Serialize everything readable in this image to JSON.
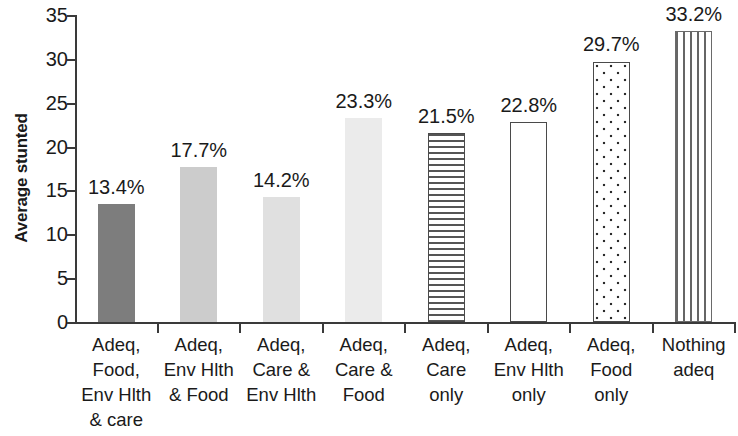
{
  "chart_data": {
    "type": "bar",
    "title": "",
    "xlabel": "",
    "ylabel": "Average stunted",
    "ylim": [
      0,
      35
    ],
    "ytick_values": [
      35,
      30,
      25,
      20,
      15,
      10,
      5,
      0
    ],
    "ytick_labels": [
      "35",
      "30",
      "25",
      "20",
      "15",
      "10",
      "5",
      "0"
    ],
    "grid": false,
    "legend": "none",
    "categories": [
      "Adeq, Food, Env Hlth & care",
      "Adeq, Env Hlth & Food",
      "Adeq, Care & Env Hlth",
      "Adeq, Care & Food",
      "Adeq, Care only",
      "Adeq, Env Hlth only",
      "Adeq, Food only",
      "Nothing adeq"
    ],
    "values": [
      13.4,
      17.7,
      14.2,
      23.3,
      21.5,
      22.8,
      29.7,
      33.2
    ],
    "data_labels": [
      "13.4%",
      "17.7%",
      "14.2%",
      "23.3%",
      "21.5%",
      "22.8%",
      "29.7%",
      "33.2%"
    ],
    "bars": [
      {
        "label_lines": [
          "Adeq,",
          "Food,",
          "Env Hlth",
          "& care"
        ],
        "value": 13.4,
        "data_label": "13.4%",
        "fill_style": "solid-dark-gray",
        "fill_class": "fill-dark",
        "color": "#7d7d7d"
      },
      {
        "label_lines": [
          "Adeq,",
          "Env Hlth",
          "& Food"
        ],
        "value": 17.7,
        "data_label": "17.7%",
        "fill_style": "solid-medium-gray",
        "fill_class": "fill-medium",
        "color": "#cccccc"
      },
      {
        "label_lines": [
          "Adeq,",
          "Care &",
          "Env Hlth"
        ],
        "value": 14.2,
        "data_label": "14.2%",
        "fill_style": "solid-light-gray",
        "fill_class": "fill-light",
        "color": "#e0e0e0"
      },
      {
        "label_lines": [
          "Adeq,",
          "Care &",
          "Food"
        ],
        "value": 23.3,
        "data_label": "23.3%",
        "fill_style": "solid-very-light-gray",
        "fill_class": "fill-lighter",
        "color": "#ebebeb"
      },
      {
        "label_lines": [
          "Adeq,",
          "Care",
          "only"
        ],
        "value": 21.5,
        "data_label": "21.5%",
        "fill_style": "horizontal-lines",
        "fill_class": "fill-hlines",
        "color": "#ffffff"
      },
      {
        "label_lines": [
          "Adeq,",
          "Env Hlth",
          "only"
        ],
        "value": 22.8,
        "data_label": "22.8%",
        "fill_style": "white-outlined",
        "fill_class": "fill-white",
        "color": "#ffffff"
      },
      {
        "label_lines": [
          "Adeq,",
          "Food",
          "only"
        ],
        "value": 29.7,
        "data_label": "29.7%",
        "fill_style": "dotted",
        "fill_class": "fill-dots",
        "color": "#ffffff"
      },
      {
        "label_lines": [
          "Nothing",
          "adeq"
        ],
        "value": 33.2,
        "data_label": "33.2%",
        "fill_style": "vertical-lines",
        "fill_class": "fill-vlines",
        "color": "#ffffff"
      }
    ],
    "axis_color": "#3a3a3a"
  }
}
